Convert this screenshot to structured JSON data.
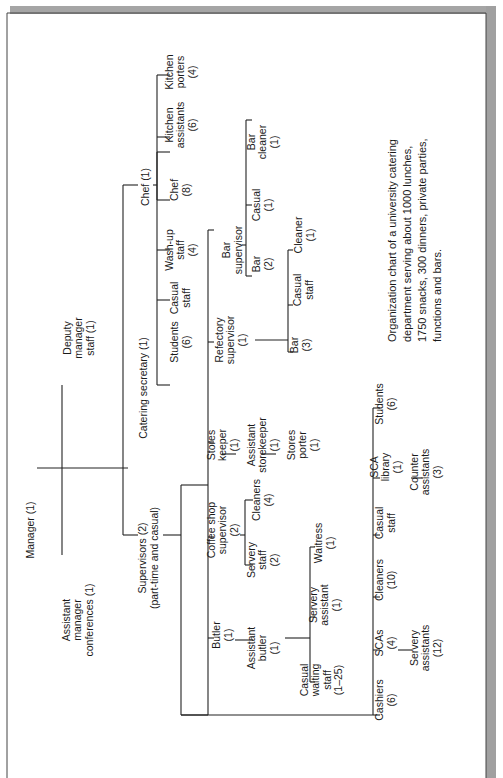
{
  "caption": [
    "Organization chart of a university catering",
    "department serving about 1000 lunches,",
    "1750 snacks, 300 dinners, private parties,",
    "functions and bars."
  ],
  "nodes": {
    "manager": [
      "Manager (1)"
    ],
    "assistant_manager": [
      "Assistant",
      "manager",
      "conferences (1)"
    ],
    "deputy_manager": [
      "Deputy",
      "manager",
      "staff (1)"
    ],
    "catering_secretary": [
      "Catering secretary (1)"
    ],
    "supervisors": [
      "Supervisors (2)",
      "(part-time and casual)"
    ],
    "chef_head": [
      "Chef (1)"
    ],
    "students_cs": [
      "Students",
      "(6)"
    ],
    "casual_staff_cs": [
      "Casual",
      "staff"
    ],
    "wash_up_staff": [
      "Wash-up",
      "staff",
      "(4)"
    ],
    "chef": [
      "Chef",
      "(8)"
    ],
    "kitchen_assistants": [
      "Kitchen",
      "assistants",
      "(6)"
    ],
    "kitchen_porters": [
      "Kitchen",
      "porters",
      "(4)"
    ],
    "refectory_supervisor": [
      "Refectory",
      "supervisor",
      "(1)"
    ],
    "bar_supervisor": [
      "Bar",
      "supervisor"
    ],
    "bar_2": [
      "Bar",
      "(2)"
    ],
    "casual_bar": [
      "Casual",
      "(1)"
    ],
    "bar_cleaner": [
      "Bar",
      "cleaner",
      "(1)"
    ],
    "bar_3": [
      "Bar",
      "(3)"
    ],
    "casual_staff_ref": [
      "Casual",
      "staff"
    ],
    "cleaner_ref": [
      "Cleaner",
      "(1)"
    ],
    "stores_keeper": [
      "Stores",
      "keeper",
      "(1)"
    ],
    "assistant_storekeeper": [
      "Assistant",
      "storekeeper",
      "(1)"
    ],
    "stores_porter": [
      "Stores",
      "porter",
      "(1)"
    ],
    "coffee_shop_supervisor": [
      "Coffee shop",
      "supervisor",
      "(2)"
    ],
    "servery_staff": [
      "Servery",
      "staff",
      "(2)"
    ],
    "cleaners_cs": [
      "Cleaners",
      "(4)"
    ],
    "butler": [
      "Butler",
      "(1)"
    ],
    "assistant_butler": [
      "Assistant",
      "butler",
      "(1)"
    ],
    "casual_waiting_staff": [
      "Casual",
      "waiting",
      "staff",
      "(1–25)"
    ],
    "servery_assistant": [
      "Servery",
      "assistant",
      "(1)"
    ],
    "waitress": [
      "Waitress",
      "(1)"
    ],
    "cashiers": [
      "Cashiers",
      "(6)"
    ],
    "scas": [
      "SCAs",
      "(4)"
    ],
    "servery_assistants": [
      "Servery",
      "assistants",
      "(12)"
    ],
    "cleaners_10": [
      "Cleaners",
      "(10)"
    ],
    "casual_staff_bottom": [
      "Casual",
      "staff"
    ],
    "sca_library": [
      "SCA",
      "library",
      "(1)"
    ],
    "counter_assistants": [
      "Counter",
      "assistants",
      "(3)"
    ],
    "students_bottom": [
      "Students",
      "(6)"
    ]
  },
  "colors": {
    "line": "#222222",
    "text": "#1a1a1a",
    "frame_shadow": "#9a9a9a",
    "background": "#ffffff"
  }
}
